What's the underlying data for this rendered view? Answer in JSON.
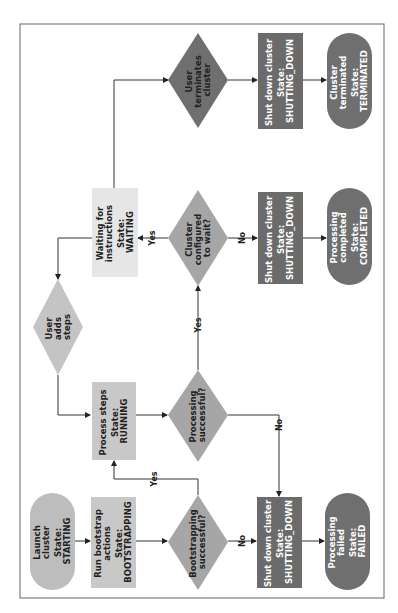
{
  "diagram": {
    "orientation": "rotated 90° counter-clockwise",
    "colors": {
      "start_fill": "#bdbdbd",
      "light_box_fill": "#c8c8c8",
      "waiting_fill": "#e6e6e6",
      "decision_fill": "#a6a6a6",
      "dark_decision_fill": "#6f6f6f",
      "shutdown_fill": "#6b6b6b",
      "end_fill": "#6f6f6f",
      "line": "#333333",
      "border": "#555555"
    },
    "nodes": {
      "launch": {
        "line1": "Launch",
        "line2": "cluster",
        "state1": "State:",
        "state2": "STARTING"
      },
      "bootstrap": {
        "line1": "Run bootstrap",
        "line2": "actions",
        "state1": "State:",
        "state2": "BOOTSTRAPPING"
      },
      "bootstrap_ok": {
        "line1": "Bootstrapping",
        "line2": "successful?"
      },
      "shutdown_fail": {
        "line1": "Shut down cluster",
        "state1": "State:",
        "state2": "SHUTTING_DOWN"
      },
      "failed": {
        "line1": "Processing",
        "line2": "failed",
        "state1": "State:",
        "state2": "FAILED"
      },
      "process": {
        "line1": "Process steps",
        "state1": "State:",
        "state2": "RUNNING"
      },
      "process_ok": {
        "line1": "Processing",
        "line2": "successful?"
      },
      "user_adds": {
        "line1": "User",
        "line2": "adds",
        "line3": "steps"
      },
      "waiting": {
        "line1": "Waiting for",
        "line2": "instructions",
        "state1": "State:",
        "state2": "WAITING"
      },
      "configured_wait": {
        "line1": "Cluster",
        "line2": "configured",
        "line3": "to wait?"
      },
      "shutdown_complete": {
        "line1": "Shut down cluster",
        "state1": "State:",
        "state2": "SHUTTING_DOWN"
      },
      "completed": {
        "line1": "Processing",
        "line2": "completed",
        "state1": "State:",
        "state2": "COMPLETED"
      },
      "user_terminates": {
        "line1": "User",
        "line2": "terminates",
        "line3": "cluster"
      },
      "shutdown_terminate": {
        "line1": "Shut down cluster",
        "state1": "State:",
        "state2": "SHUTTING_DOWN"
      },
      "terminated": {
        "line1": "Cluster",
        "line2": "terminated",
        "state1": "State:",
        "state2": "TERMINATED"
      }
    },
    "edge_labels": {
      "bootstrap_yes": "Yes",
      "bootstrap_no": "No",
      "process_yes": "Yes",
      "process_no": "No",
      "wait_yes": "Yes",
      "wait_no": "No"
    }
  }
}
